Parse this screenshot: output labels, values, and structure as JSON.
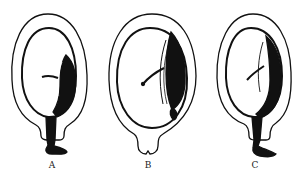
{
  "figure": {
    "panels": [
      {
        "id": "A",
        "label": "A",
        "description": "uterus with placenta on right wall, cervix open with dark discharge"
      },
      {
        "id": "B",
        "label": "B",
        "description": "uterus with placenta on right wall, cervix closed"
      },
      {
        "id": "C",
        "label": "C",
        "description": "uterus with placenta on right wall, cervix with dark flowing discharge"
      }
    ],
    "colors": {
      "ink": "#111111",
      "background": "#ffffff"
    }
  }
}
